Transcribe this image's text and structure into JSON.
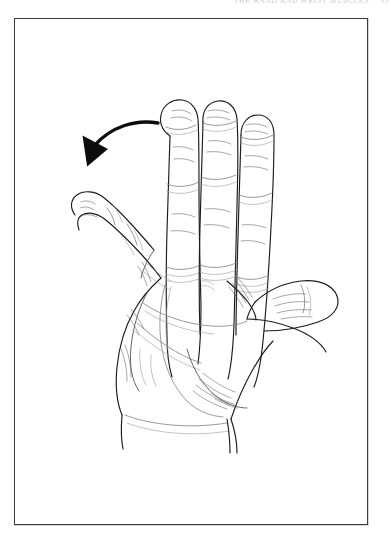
{
  "page": {
    "width": 391,
    "height": 541,
    "background_color": "#ffffff"
  },
  "running_head": {
    "text": "THE HAND AND WRIST MUSCLES",
    "page_number": "95",
    "color": "#b9b9bd",
    "note": "faint running head clipped by the top edge of the scan; partially legible"
  },
  "figure": {
    "frame": {
      "x": 14,
      "y": 18,
      "width": 354,
      "height": 507,
      "border_color": "#3b3b3d",
      "border_width": 1,
      "fill_color": "#ffffff"
    },
    "caption": "",
    "ink_color": "#1c1c1e",
    "crease_color": "#7d7d82",
    "elements": [
      {
        "name": "little-finger",
        "label": "little finger",
        "state": "abducted to the left"
      },
      {
        "name": "ring-finger",
        "label": "ring finger",
        "state": "extended"
      },
      {
        "name": "middle-finger",
        "label": "middle finger",
        "state": "extended"
      },
      {
        "name": "index-finger",
        "label": "index finger",
        "state": "extended"
      },
      {
        "name": "thumb",
        "label": "thumb",
        "state": "abducted to the right"
      },
      {
        "name": "palm",
        "label": "palm",
        "state": "facing viewer"
      },
      {
        "name": "wrist",
        "label": "wrist",
        "state": "fading at lower edge"
      }
    ],
    "motion_arrow": {
      "name": "abduction-arrow",
      "color": "#0d0d0f",
      "direction": "curving left and downward",
      "indicates": "little finger abduction",
      "start": [
        157,
        122
      ],
      "end": [
        79,
        160
      ]
    }
  }
}
